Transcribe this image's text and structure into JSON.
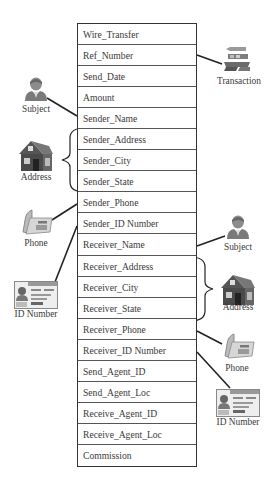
{
  "diagram": {
    "type": "record-schema-with-entity-links",
    "table": {
      "rows": [
        "Wire_Transfer",
        "Ref_Number",
        "Send_Date",
        "Amount",
        "Sender_Name",
        "Sender_Address",
        "Sender_City",
        "Sender_State",
        "Sender_Phone",
        "Sender_ID Number",
        "Receiver_Name",
        "Receiver_Address",
        "Receiver_City",
        "Receiver_State",
        "Receiver_Phone",
        "Receiver_ID Number",
        "Send_Agent_ID",
        "Send_Agent_Loc",
        "Receive_Agent_ID",
        "Receive_Agent_Loc",
        "Commission"
      ]
    },
    "entities": {
      "transaction": {
        "label": "Transaction",
        "icon": "transaction-icon",
        "links_to": "Ref_Number"
      },
      "sender_subject": {
        "label": "Subject",
        "icon": "person-icon",
        "links_to": "Sender_Name"
      },
      "sender_address": {
        "label": "Address",
        "icon": "house-icon",
        "links_to": [
          "Sender_Address",
          "Sender_City",
          "Sender_State"
        ]
      },
      "sender_phone": {
        "label": "Phone",
        "icon": "phone-icon",
        "links_to": "Sender_Phone"
      },
      "sender_id": {
        "label": "ID Number",
        "icon": "id-card-icon",
        "links_to": "Sender_ID Number"
      },
      "receiver_subject": {
        "label": "Subject",
        "icon": "person-icon",
        "links_to": "Receiver_Name"
      },
      "receiver_address": {
        "label": "Address",
        "icon": "house-icon",
        "links_to": [
          "Receiver_Address",
          "Receiver_City",
          "Receiver_State"
        ]
      },
      "receiver_phone": {
        "label": "Phone",
        "icon": "phone-icon",
        "links_to": "Receiver_Phone"
      },
      "receiver_id": {
        "label": "ID Number",
        "icon": "id-card-icon",
        "links_to": "Receiver_ID Number"
      }
    },
    "colors": {
      "line": "#222222",
      "table_border": "#333333",
      "text": "#3a3a3a"
    }
  }
}
